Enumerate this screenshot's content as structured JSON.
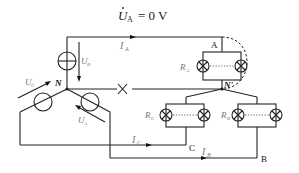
{
  "title": {
    "equation": "U̇A = 0 V",
    "symbol": "U",
    "subscript": "A",
    "rhs": "= 0 V"
  },
  "labels": {
    "neutral_source": "N",
    "neutral_load": "N'",
    "node_a": "A",
    "node_b": "B",
    "node_c": "C",
    "current_a": "I",
    "current_a_sub": "A",
    "current_b": "I",
    "current_b_sub": "B",
    "current_c": "I",
    "current_c_sub": "C",
    "voltage_source_b": "U",
    "voltage_source_b_sub": "B",
    "voltage_source_c": "U",
    "voltage_source_c_sub": "C",
    "voltage_source_a": "U",
    "voltage_source_a_sub": "A",
    "resistor_a": "R",
    "resistor_a_sub": "A",
    "resistor_b": "R",
    "resistor_b_sub": "B",
    "resistor_c": "R",
    "resistor_c_sub": "C"
  },
  "annotations": {
    "neutral_break": "broken-neutral",
    "short_a": "short-circuit-phase-A"
  }
}
